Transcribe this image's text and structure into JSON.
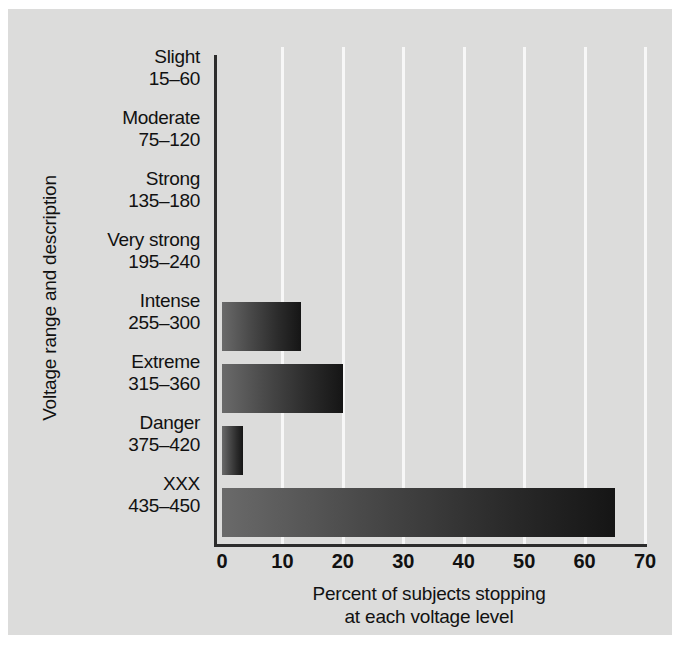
{
  "chart_data": {
    "type": "bar",
    "orientation": "horizontal",
    "title": "",
    "xlabel_line1": "Percent of subjects stopping",
    "xlabel_line2": "at each voltage level",
    "ylabel": "Voltage range and description",
    "categories": [
      {
        "name": "Slight",
        "range": "15–60"
      },
      {
        "name": "Moderate",
        "range": "75–120"
      },
      {
        "name": "Strong",
        "range": "135–180"
      },
      {
        "name": "Very strong",
        "range": "195–240"
      },
      {
        "name": "Intense",
        "range": "255–300"
      },
      {
        "name": "Extreme",
        "range": "315–360"
      },
      {
        "name": "Danger",
        "range": "375–420"
      },
      {
        "name": "XXX",
        "range": "435–450"
      }
    ],
    "values": [
      0,
      0,
      0,
      0,
      13,
      20,
      3.5,
      65
    ],
    "xlim": [
      0,
      70
    ],
    "xticks": [
      0,
      10,
      20,
      30,
      40,
      50,
      60,
      70
    ],
    "grid": "vertical-white",
    "legend": "none",
    "bar_gradient_from": "#6a6a6a",
    "bar_gradient_to": "#151515",
    "background": "#dcdcdb",
    "axis_color": "#2c2c2c",
    "gridline_color": "#f7f7f7"
  }
}
